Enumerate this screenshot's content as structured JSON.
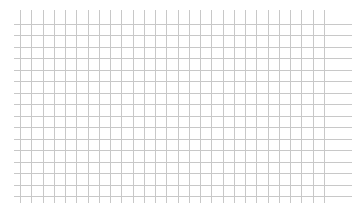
{
  "canvas": {
    "width": 359,
    "height": 203,
    "background": "#ffffff"
  },
  "grid": {
    "line_color": "#c8c8c8",
    "vertical": {
      "x_start": 20,
      "x_end": 324,
      "count": 28,
      "y_top": 10,
      "y_bottom": 203
    },
    "horizontal": {
      "y_start": 24,
      "y_end": 196,
      "count": 16,
      "x_left": 14,
      "x_right": 352
    }
  }
}
